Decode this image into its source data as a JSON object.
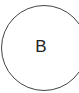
{
  "diagram": {
    "nodes": [
      {
        "id": "B",
        "label": "B",
        "shape": "circle",
        "stroke": "#444444",
        "fill": "#ffffff"
      }
    ]
  }
}
